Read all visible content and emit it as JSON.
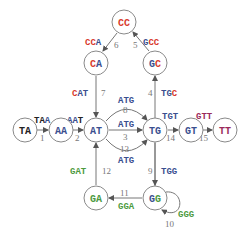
{
  "colors": {
    "A": "#3a4f8f",
    "C": "#d8392b",
    "G": "#4c9a3e",
    "T": "#9a2a5a",
    "TA_dark": "#222222"
  },
  "nodes": [
    {
      "id": "CC",
      "x": 124,
      "y": 22
    },
    {
      "id": "CA",
      "x": 96,
      "y": 63
    },
    {
      "id": "GC",
      "x": 155,
      "y": 63
    },
    {
      "id": "TA",
      "x": 25,
      "y": 130
    },
    {
      "id": "AA",
      "x": 61,
      "y": 130
    },
    {
      "id": "AT",
      "x": 96,
      "y": 130
    },
    {
      "id": "TG",
      "x": 155,
      "y": 130
    },
    {
      "id": "GT",
      "x": 191,
      "y": 130
    },
    {
      "id": "TT",
      "x": 225,
      "y": 130
    },
    {
      "id": "GA",
      "x": 96,
      "y": 198
    },
    {
      "id": "GG",
      "x": 155,
      "y": 198
    }
  ],
  "edges": [
    {
      "num": "1",
      "from": "TA",
      "to": "AA",
      "label": "TAA"
    },
    {
      "num": "2",
      "from": "AA",
      "to": "AT",
      "label": "AAT"
    },
    {
      "num": "3",
      "from": "AT",
      "to": "TG",
      "label": "ATG"
    },
    {
      "num": "4",
      "from": "TG",
      "to": "GC",
      "label": "TGC"
    },
    {
      "num": "5",
      "from": "GC",
      "to": "CC",
      "label": "GCC"
    },
    {
      "num": "6",
      "from": "CC",
      "to": "CA",
      "label": "CCA"
    },
    {
      "num": "7",
      "from": "CA",
      "to": "AT",
      "label": "CAT"
    },
    {
      "num": "8",
      "from": "AT",
      "to": "TG",
      "label": "ATG"
    },
    {
      "num": "9",
      "from": "TG",
      "to": "GG",
      "label": "TGG"
    },
    {
      "num": "10",
      "from": "GG",
      "to": "GG",
      "label": "GGG"
    },
    {
      "num": "11",
      "from": "GG",
      "to": "GA",
      "label": "GGA"
    },
    {
      "num": "12",
      "from": "GA",
      "to": "AT",
      "label": "GAT"
    },
    {
      "num": "13",
      "from": "AT",
      "to": "TG",
      "label": "ATG"
    },
    {
      "num": "14",
      "from": "TG",
      "to": "GT",
      "label": "TGT"
    },
    {
      "num": "15",
      "from": "GT",
      "to": "TT",
      "label": "GTT"
    }
  ]
}
